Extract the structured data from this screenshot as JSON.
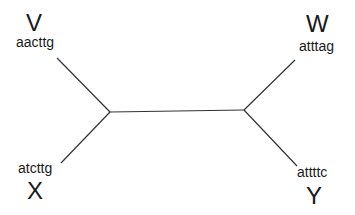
{
  "diagram": {
    "type": "unrooted phylogenetic tree",
    "line_color": "#333333",
    "taxa": [
      {
        "id": "V",
        "label": "V",
        "sequence": "aacttg",
        "position": "top-left"
      },
      {
        "id": "W",
        "label": "W",
        "sequence": "atttag",
        "position": "top-right"
      },
      {
        "id": "X",
        "label": "X",
        "sequence": "atcttg",
        "position": "bottom-left"
      },
      {
        "id": "Y",
        "label": "Y",
        "sequence": "attttc",
        "position": "bottom-right"
      }
    ],
    "internal_nodes": [
      {
        "id": "left-junction",
        "x": 110,
        "y": 112
      },
      {
        "id": "right-junction",
        "x": 244,
        "y": 110
      }
    ],
    "edges": [
      {
        "from": "V",
        "to": "left-junction",
        "x1": 57,
        "y1": 58,
        "x2": 110,
        "y2": 112
      },
      {
        "from": "X",
        "to": "left-junction",
        "x1": 61,
        "y1": 163,
        "x2": 110,
        "y2": 112
      },
      {
        "from": "left-junction",
        "to": "right-junction",
        "x1": 110,
        "y1": 112,
        "x2": 244,
        "y2": 110
      },
      {
        "from": "W",
        "to": "right-junction",
        "x1": 295,
        "y1": 60,
        "x2": 244,
        "y2": 110
      },
      {
        "from": "Y",
        "to": "right-junction",
        "x1": 297,
        "y1": 166,
        "x2": 244,
        "y2": 110
      }
    ]
  }
}
